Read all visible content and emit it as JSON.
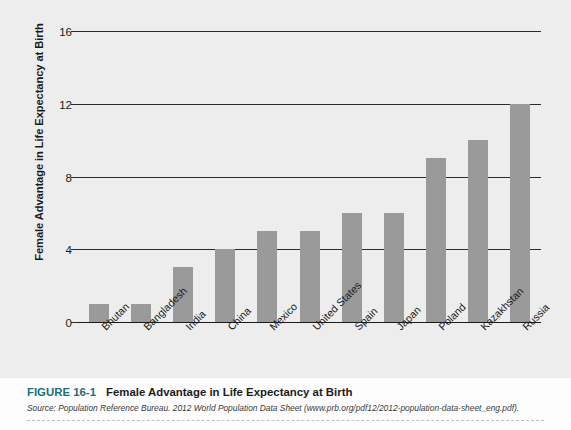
{
  "chart_data": {
    "type": "bar",
    "title": "Female Advantage in Life Expectancy at Birth",
    "xlabel": "",
    "ylabel": "Female Advantage in Life Expectancy at Birth",
    "ylim": [
      0,
      16
    ],
    "yticks": [
      0,
      4,
      8,
      12,
      16
    ],
    "grid": true,
    "legend": "none",
    "bar_color": "#9a9a9a",
    "categories": [
      "Bhutan",
      "Bangladesh",
      "India",
      "China",
      "Mexico",
      "United States",
      "Spain",
      "Japan",
      "Poland",
      "Kazakhstan",
      "Russia"
    ],
    "values": [
      1,
      1,
      3,
      4,
      5,
      5,
      6,
      6,
      9,
      10,
      12
    ]
  },
  "figure": {
    "number_label": "FIGURE 16-1",
    "title": "Female Advantage in Life Expectancy at Birth",
    "source": "Source: Population Reference Bureau. 2012 World Population Data Sheet (www.prb.org/pdf12/2012-population-data-sheet_eng.pdf).",
    "accent_color": "#1b6f78"
  },
  "colors": {
    "page_background": "#ededed",
    "caption_background": "#fdfdfd",
    "bar": "#9a9a9a",
    "gridline": "#2b2b2b",
    "accent": "#1b6f78"
  }
}
